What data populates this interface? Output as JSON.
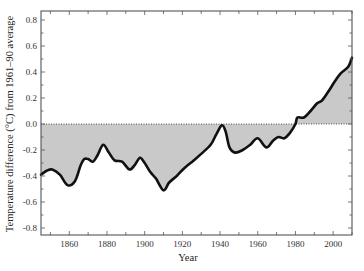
{
  "chart_data": {
    "type": "area",
    "title": "",
    "xlabel": "Year",
    "ylabel": "Temperature difference (°C) from 1961–90 average",
    "xlim": [
      1845,
      2010
    ],
    "ylim": [
      -0.85,
      0.85
    ],
    "x_ticks": [
      1860,
      1880,
      1900,
      1920,
      1940,
      1960,
      1980,
      2000
    ],
    "x_tick_labels": [
      "1860",
      "1880",
      "1900",
      "1920",
      "1940",
      "1960",
      "1980",
      "2000"
    ],
    "y_ticks": [
      0.8,
      0.6,
      0.4,
      0.2,
      0.0,
      -0.2,
      -0.4,
      -0.6,
      -0.8
    ],
    "y_tick_labels": [
      "0.8",
      "0.6",
      "0.4",
      "0.2",
      "0.0",
      "-0.2",
      "-0.4",
      "-0.6",
      "-0.8"
    ],
    "grid": false,
    "legend": null,
    "baseline": 0.0,
    "baseline_style": "dotted",
    "fill_color": "#c9c9c9",
    "line_color": "#111111",
    "series": [
      {
        "name": "Smoothed global temperature anomaly",
        "x": [
          1845,
          1848,
          1851,
          1855,
          1859,
          1863,
          1866,
          1868,
          1870,
          1872.5,
          1875,
          1878,
          1881,
          1884,
          1888,
          1892,
          1895,
          1897.5,
          1900,
          1903,
          1906,
          1910,
          1913,
          1917,
          1921,
          1926,
          1930,
          1935,
          1938,
          1941,
          1943,
          1945,
          1948,
          1952,
          1956,
          1960,
          1964.5,
          1968,
          1971,
          1974,
          1977,
          1980,
          1981,
          1984.5,
          1988,
          1991.5,
          1994,
          1997,
          2001,
          2004,
          2008,
          2010
        ],
        "y": [
          -0.39,
          -0.36,
          -0.35,
          -0.39,
          -0.47,
          -0.44,
          -0.32,
          -0.27,
          -0.27,
          -0.29,
          -0.24,
          -0.16,
          -0.22,
          -0.28,
          -0.29,
          -0.35,
          -0.31,
          -0.26,
          -0.3,
          -0.37,
          -0.42,
          -0.51,
          -0.45,
          -0.4,
          -0.34,
          -0.28,
          -0.23,
          -0.16,
          -0.08,
          -0.01,
          -0.06,
          -0.18,
          -0.22,
          -0.2,
          -0.16,
          -0.11,
          -0.18,
          -0.13,
          -0.1,
          -0.11,
          -0.07,
          0.0,
          0.05,
          0.05,
          0.1,
          0.16,
          0.18,
          0.24,
          0.33,
          0.39,
          0.44,
          0.51
        ]
      }
    ]
  }
}
